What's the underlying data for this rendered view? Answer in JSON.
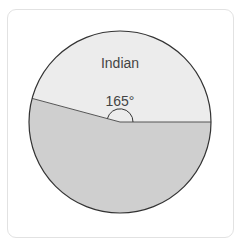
{
  "diagram": {
    "type": "pie-sector",
    "sector_label": "Indian",
    "angle_label": "165°",
    "angle_degrees": 165,
    "colors": {
      "upper_sector": "#ececec",
      "lower_sector": "#cfcfcf",
      "outline": "#333333",
      "frame_border": "#e2e2e2"
    }
  }
}
